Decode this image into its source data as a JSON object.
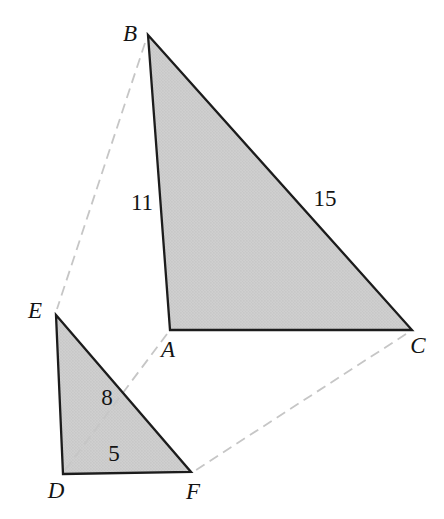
{
  "figure": {
    "width": 444,
    "height": 519,
    "background": "#ffffff",
    "style": {
      "fill": "#cfcfcf",
      "fill_dot": "#bdbdbd",
      "stroke": "#1c1c1c",
      "stroke_width": 2.3,
      "dash_color": "#c6c6c6",
      "dash_width": 1.8,
      "dash_pattern": "10 6",
      "label_color": "#141414",
      "label_font_size": 23
    },
    "triangles": [
      {
        "id": "triangle-ABC",
        "points": [
          [
            148,
            35
          ],
          [
            412,
            330
          ],
          [
            170,
            330
          ]
        ]
      },
      {
        "id": "triangle-DEF",
        "points": [
          [
            56,
            315
          ],
          [
            191,
            472
          ],
          [
            63,
            474
          ]
        ]
      }
    ],
    "dashed_lines": [
      {
        "id": "connector-B-E",
        "from": [
          145,
          43
        ],
        "to": [
          57,
          309
        ]
      },
      {
        "id": "connector-A-D",
        "from": [
          167,
          334
        ],
        "to": [
          65,
          470
        ]
      },
      {
        "id": "connector-C-F",
        "from": [
          406,
          334
        ],
        "to": [
          196,
          470
        ]
      }
    ],
    "vertex_labels": [
      {
        "text": "B",
        "x": 130,
        "y": 33,
        "italic": true
      },
      {
        "text": "A",
        "x": 168,
        "y": 349,
        "italic": true
      },
      {
        "text": "C",
        "x": 418,
        "y": 345,
        "italic": true
      },
      {
        "text": "E",
        "x": 35,
        "y": 310,
        "italic": true
      },
      {
        "text": "D",
        "x": 56,
        "y": 490,
        "italic": true
      },
      {
        "text": "F",
        "x": 193,
        "y": 491,
        "italic": true
      }
    ],
    "side_labels": [
      {
        "text": "11",
        "x": 142,
        "y": 202
      },
      {
        "text": "15",
        "x": 325,
        "y": 198
      },
      {
        "text": "8",
        "x": 107,
        "y": 397
      },
      {
        "text": "5",
        "x": 114,
        "y": 453
      }
    ]
  }
}
